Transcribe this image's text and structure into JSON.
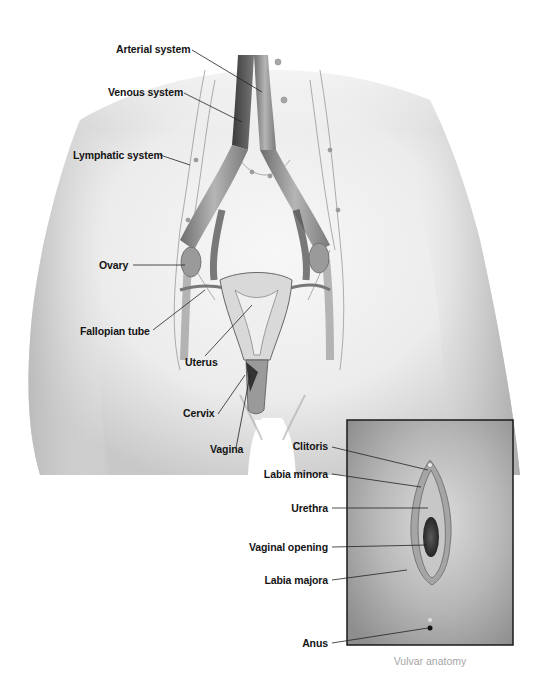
{
  "figure": {
    "main_labels": [
      {
        "id": "arterial",
        "text": "Arterial system"
      },
      {
        "id": "venous",
        "text": "Venous system"
      },
      {
        "id": "lymphatic",
        "text": "Lymphatic system"
      },
      {
        "id": "ovary",
        "text": "Ovary"
      },
      {
        "id": "fallopian",
        "text": "Fallopian tube"
      },
      {
        "id": "uterus",
        "text": "Uterus"
      },
      {
        "id": "cervix",
        "text": "Cervix"
      },
      {
        "id": "vagina",
        "text": "Vagina"
      }
    ],
    "inset": {
      "caption": "Vulvar anatomy",
      "labels": [
        {
          "id": "clitoris",
          "text": "Clitoris"
        },
        {
          "id": "labia_minora",
          "text": "Labia minora"
        },
        {
          "id": "urethra",
          "text": "Urethra"
        },
        {
          "id": "vaginal_opening",
          "text": "Vaginal opening"
        },
        {
          "id": "labia_majora",
          "text": "Labia majora"
        },
        {
          "id": "anus",
          "text": "Anus"
        }
      ]
    },
    "colors": {
      "background": "#ffffff",
      "skin_shadow": "#bdbdbd",
      "vessel_dark": "#555555",
      "label_text": "#141414",
      "caption_text": "#a6a6a6",
      "inset_border": "#1a1a1a"
    }
  }
}
